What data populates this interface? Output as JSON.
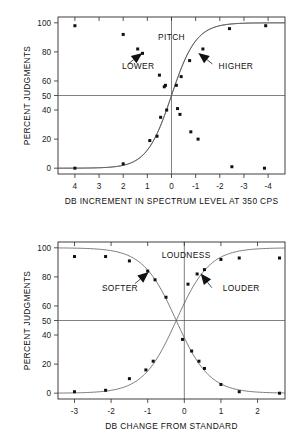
{
  "figure": {
    "title": "",
    "caption_partial": ""
  },
  "chart_data": [
    {
      "type": "scatter",
      "title": "PITCH",
      "panel": "top",
      "xlabel": "DB INCREMENT IN SPECTRUM LEVEL AT 350 CPS",
      "ylabel": "PERCENT JUDGMENTS",
      "xlim": [
        4.7,
        -4.7
      ],
      "ylim": [
        -4,
        104
      ],
      "x_axis_reversed": true,
      "xticks": [
        4,
        3,
        2,
        1,
        0,
        -1,
        -2,
        -3,
        -4
      ],
      "xticklabels": [
        "4",
        "3",
        "2",
        "1",
        "0",
        "-1",
        "-2",
        "-3",
        "-4"
      ],
      "yticks": [
        0,
        20,
        40,
        50,
        60,
        80,
        100
      ],
      "yticklabels": [
        "0",
        "20",
        "40",
        "50",
        "60",
        "80",
        "100"
      ],
      "grid": false,
      "reference_lines": {
        "horizontal": 50,
        "vertical": 0
      },
      "legend": "none",
      "annotations": [
        {
          "text": "PITCH",
          "x": 0.0,
          "y": 88
        },
        {
          "text": "LOWER",
          "x": 2.05,
          "y": 68
        },
        {
          "text": "HIGHER",
          "x": -1.95,
          "y": 68
        }
      ],
      "series": [
        {
          "name": "LOWER",
          "points": [
            {
              "x": 4.0,
              "y": 98
            },
            {
              "x": 2.0,
              "y": 92
            },
            {
              "x": 1.4,
              "y": 82
            },
            {
              "x": 1.2,
              "y": 79
            },
            {
              "x": 0.5,
              "y": 64
            },
            {
              "x": 0.25,
              "y": 57
            },
            {
              "x": 0.3,
              "y": 56
            },
            {
              "x": -0.2,
              "y": 57
            },
            {
              "x": -0.4,
              "y": 63
            },
            {
              "x": -0.75,
              "y": 74
            },
            {
              "x": -1.3,
              "y": 82
            },
            {
              "x": -2.4,
              "y": 96
            },
            {
              "x": -3.9,
              "y": 98
            }
          ]
        },
        {
          "name": "HIGHER",
          "points": [
            {
              "x": 4.0,
              "y": 0
            },
            {
              "x": 2.0,
              "y": 3
            },
            {
              "x": 0.9,
              "y": 19
            },
            {
              "x": 0.6,
              "y": 22
            },
            {
              "x": 0.45,
              "y": 35
            },
            {
              "x": 0.2,
              "y": 40
            },
            {
              "x": -0.25,
              "y": 41
            },
            {
              "x": -0.35,
              "y": 37
            },
            {
              "x": -0.8,
              "y": 25
            },
            {
              "x": -1.1,
              "y": 20
            },
            {
              "x": -2.5,
              "y": 1
            },
            {
              "x": -3.85,
              "y": 0
            }
          ]
        }
      ]
    },
    {
      "type": "scatter",
      "title": "LOUDNESS",
      "panel": "bottom",
      "xlabel": "DB CHANGE FROM STANDARD",
      "ylabel": "PERCENT JUDGMENTS",
      "xlim": [
        -3.45,
        2.75
      ],
      "ylim": [
        -4,
        104
      ],
      "x_axis_reversed": false,
      "xticks": [
        -3,
        -2,
        -1,
        0,
        1,
        2
      ],
      "xticklabels": [
        "-3",
        "-2",
        "-1",
        "0",
        "1",
        "2"
      ],
      "yticks": [
        0,
        20,
        40,
        50,
        60,
        80,
        100
      ],
      "yticklabels": [
        "0",
        "20",
        "40",
        "50",
        "60",
        "80",
        "100"
      ],
      "grid": false,
      "reference_lines": {
        "horizontal": 50,
        "vertical": 0
      },
      "legend": "none",
      "annotations": [
        {
          "text": "LOUDNESS",
          "x": 0.05,
          "y": 93
        },
        {
          "text": "SOFTER",
          "x": -2.25,
          "y": 70
        },
        {
          "text": "LOUDER",
          "x": 1.05,
          "y": 70
        }
      ],
      "series": [
        {
          "name": "SOFTER",
          "points": [
            {
              "x": -3.0,
              "y": 94
            },
            {
              "x": -2.15,
              "y": 94
            },
            {
              "x": -1.5,
              "y": 91
            },
            {
              "x": -1.0,
              "y": 84
            },
            {
              "x": -0.8,
              "y": 78
            },
            {
              "x": -0.5,
              "y": 66
            },
            {
              "x": -0.05,
              "y": 37
            },
            {
              "x": 0.2,
              "y": 29
            },
            {
              "x": 0.4,
              "y": 22
            },
            {
              "x": 0.55,
              "y": 17
            },
            {
              "x": 1.0,
              "y": 6
            },
            {
              "x": 1.5,
              "y": 1
            },
            {
              "x": 2.6,
              "y": 0
            }
          ]
        },
        {
          "name": "LOUDER",
          "points": [
            {
              "x": -3.0,
              "y": 1
            },
            {
              "x": -2.15,
              "y": 2
            },
            {
              "x": -1.5,
              "y": 10
            },
            {
              "x": -1.05,
              "y": 16
            },
            {
              "x": -0.85,
              "y": 22
            },
            {
              "x": 0.1,
              "y": 75
            },
            {
              "x": 0.35,
              "y": 82
            },
            {
              "x": 0.55,
              "y": 85
            },
            {
              "x": 1.0,
              "y": 92
            },
            {
              "x": 1.5,
              "y": 93
            },
            {
              "x": 2.6,
              "y": 93
            }
          ]
        }
      ]
    }
  ]
}
